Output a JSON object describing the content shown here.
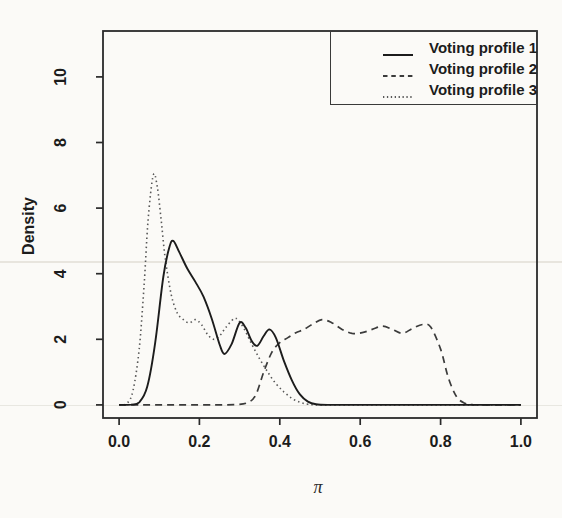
{
  "figure": {
    "background": "#fbfaf7",
    "axis_color": "#2a2a2a"
  },
  "chart_data": {
    "type": "line",
    "subtype": "kernel-density",
    "title": "",
    "xlabel": "π",
    "ylabel": "Density",
    "xlim": [
      -0.04,
      1.04
    ],
    "ylim": [
      -0.4,
      11.4
    ],
    "x_tick_values": [
      0.0,
      0.2,
      0.4,
      0.6,
      0.8,
      1.0
    ],
    "x_tick_labels": [
      "0.0",
      "0.2",
      "0.4",
      "0.6",
      "0.8",
      "1.0"
    ],
    "y_tick_values": [
      0,
      2,
      4,
      6,
      8,
      10
    ],
    "y_tick_labels": [
      "0",
      "2",
      "4",
      "6",
      "8",
      "10"
    ],
    "grid": false,
    "legend_position": "topright",
    "series": [
      {
        "name": "Voting profile 1",
        "line_style": "solid",
        "color": "#1c1c1c",
        "points": [
          [
            0,
            0
          ],
          [
            0.03,
            0.01
          ],
          [
            0.05,
            0.08
          ],
          [
            0.07,
            0.55
          ],
          [
            0.09,
            1.9
          ],
          [
            0.11,
            3.9
          ],
          [
            0.125,
            4.8
          ],
          [
            0.135,
            5.0
          ],
          [
            0.15,
            4.65
          ],
          [
            0.17,
            4.15
          ],
          [
            0.19,
            3.75
          ],
          [
            0.21,
            3.3
          ],
          [
            0.23,
            2.65
          ],
          [
            0.25,
            1.85
          ],
          [
            0.262,
            1.55
          ],
          [
            0.28,
            1.85
          ],
          [
            0.3,
            2.5
          ],
          [
            0.315,
            2.35
          ],
          [
            0.33,
            1.95
          ],
          [
            0.344,
            1.8
          ],
          [
            0.36,
            2.1
          ],
          [
            0.374,
            2.3
          ],
          [
            0.39,
            2.05
          ],
          [
            0.41,
            1.35
          ],
          [
            0.43,
            0.75
          ],
          [
            0.45,
            0.32
          ],
          [
            0.47,
            0.1
          ],
          [
            0.49,
            0.02
          ],
          [
            0.52,
            0
          ],
          [
            0.6,
            0
          ],
          [
            0.7,
            0
          ],
          [
            0.8,
            0
          ],
          [
            0.9,
            0
          ],
          [
            1,
            0
          ]
        ]
      },
      {
        "name": "Voting profile 2",
        "line_style": "dashed",
        "color": "#3b3b3b",
        "points": [
          [
            0,
            0
          ],
          [
            0.06,
            0
          ],
          [
            0.12,
            0
          ],
          [
            0.18,
            0
          ],
          [
            0.24,
            0
          ],
          [
            0.29,
            0.01
          ],
          [
            0.32,
            0.07
          ],
          [
            0.34,
            0.3
          ],
          [
            0.36,
            1.0
          ],
          [
            0.38,
            1.6
          ],
          [
            0.4,
            1.9
          ],
          [
            0.42,
            2.05
          ],
          [
            0.44,
            2.2
          ],
          [
            0.46,
            2.3
          ],
          [
            0.48,
            2.45
          ],
          [
            0.505,
            2.6
          ],
          [
            0.53,
            2.5
          ],
          [
            0.555,
            2.3
          ],
          [
            0.58,
            2.18
          ],
          [
            0.605,
            2.2
          ],
          [
            0.63,
            2.3
          ],
          [
            0.655,
            2.4
          ],
          [
            0.68,
            2.3
          ],
          [
            0.705,
            2.18
          ],
          [
            0.73,
            2.33
          ],
          [
            0.755,
            2.45
          ],
          [
            0.775,
            2.38
          ],
          [
            0.8,
            1.7
          ],
          [
            0.82,
            0.8
          ],
          [
            0.84,
            0.25
          ],
          [
            0.86,
            0.05
          ],
          [
            0.88,
            0.01
          ],
          [
            0.92,
            0
          ],
          [
            1,
            0
          ]
        ]
      },
      {
        "name": "Voting profile 3",
        "line_style": "dotted",
        "color": "#585858",
        "points": [
          [
            0,
            0
          ],
          [
            0.02,
            0.05
          ],
          [
            0.035,
            0.45
          ],
          [
            0.05,
            1.7
          ],
          [
            0.062,
            3.6
          ],
          [
            0.072,
            5.6
          ],
          [
            0.085,
            7.0
          ],
          [
            0.095,
            6.65
          ],
          [
            0.105,
            5.6
          ],
          [
            0.115,
            4.45
          ],
          [
            0.13,
            3.35
          ],
          [
            0.145,
            2.8
          ],
          [
            0.16,
            2.6
          ],
          [
            0.175,
            2.5
          ],
          [
            0.19,
            2.6
          ],
          [
            0.205,
            2.45
          ],
          [
            0.22,
            2.15
          ],
          [
            0.235,
            2.0
          ],
          [
            0.25,
            2.1
          ],
          [
            0.265,
            2.35
          ],
          [
            0.285,
            2.62
          ],
          [
            0.295,
            2.6
          ],
          [
            0.31,
            2.35
          ],
          [
            0.33,
            1.85
          ],
          [
            0.35,
            1.4
          ],
          [
            0.37,
            1.0
          ],
          [
            0.39,
            0.65
          ],
          [
            0.41,
            0.4
          ],
          [
            0.43,
            0.2
          ],
          [
            0.45,
            0.08
          ],
          [
            0.47,
            0.02
          ],
          [
            0.5,
            0
          ],
          [
            0.6,
            0
          ],
          [
            0.75,
            0
          ],
          [
            1,
            0
          ]
        ]
      }
    ]
  }
}
